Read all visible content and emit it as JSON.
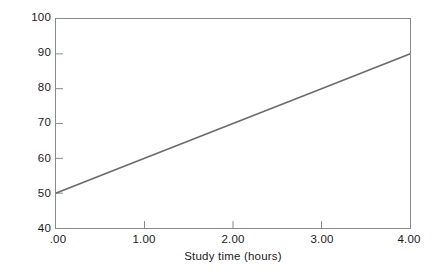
{
  "chart_data": {
    "type": "line",
    "title": "",
    "subtitle": "",
    "xlabel": "Study time (hours)",
    "ylabel": "Grade received",
    "x": [
      0,
      1,
      2,
      3,
      4
    ],
    "series": [
      {
        "name": "Predicted grade",
        "values": [
          50,
          60,
          70,
          80,
          90
        ],
        "color": "#6b6b6b"
      }
    ],
    "xlim": [
      0,
      4
    ],
    "ylim": [
      40,
      100
    ],
    "xticks": [
      0,
      1,
      2,
      3,
      4
    ],
    "yticks": [
      40,
      50,
      60,
      70,
      80,
      90,
      100
    ],
    "xtick_labels": [
      ".00",
      "1.00",
      "2.00",
      "3.00",
      "4.00"
    ],
    "ytick_labels": [
      "40",
      "50",
      "60",
      "70",
      "80",
      "90",
      "100"
    ],
    "grid": false,
    "legend": false,
    "legend_position": "none",
    "annotations": [],
    "axis_color": "#8a8a8a",
    "background_color": "#ffffff",
    "tick_direction": "in"
  }
}
